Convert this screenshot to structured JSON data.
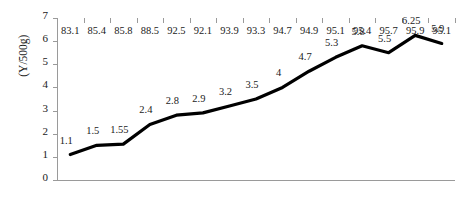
{
  "chart_data": {
    "type": "line",
    "title": "",
    "xlabel": "",
    "ylabel": "(Y/500g)",
    "categories": [
      "83.1",
      "85.4",
      "85.8",
      "88.5",
      "92.5",
      "92.1",
      "93.9",
      "93.3",
      "94.7",
      "94.9",
      "95.1",
      "95.4",
      "95.7",
      "95.9",
      "95.1"
    ],
    "values": [
      1.1,
      1.5,
      1.55,
      2.4,
      2.8,
      2.9,
      3.2,
      3.5,
      4,
      4.7,
      5.3,
      5.8,
      5.5,
      6.25,
      5.9
    ],
    "point_labels": [
      "1.1",
      "1.5",
      "1.55",
      "2.4",
      "2.8",
      "2.9",
      "3.2",
      "3.5",
      "4",
      "4.7",
      "5.3",
      "5.8",
      "5.5",
      "6.25",
      "5.9"
    ],
    "ylim": [
      0,
      7
    ],
    "yticks": [
      0,
      1,
      2,
      3,
      4,
      5,
      6,
      7
    ],
    "ytick_labels": [
      "0",
      "1",
      "2",
      "3",
      "4",
      "5",
      "6",
      "7"
    ],
    "grid": false,
    "legend": null,
    "series_color": "#000000"
  }
}
